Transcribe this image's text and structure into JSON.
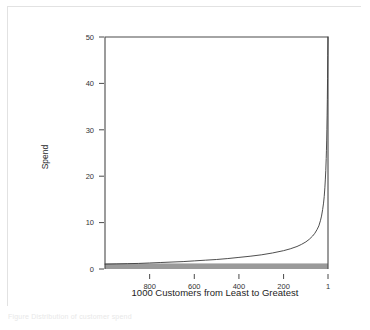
{
  "figure": {
    "caption_fragment": "Figure  Distribution of customer spend"
  },
  "chart_data": {
    "type": "line",
    "title": "",
    "xlabel": "1000 Customers from Least to Greatest",
    "ylabel": "Spend",
    "xlim": [
      1000,
      1
    ],
    "ylim": [
      0,
      50
    ],
    "x_reversed": true,
    "grid": false,
    "legend": "none",
    "xticks": [
      800,
      600,
      400,
      200,
      1
    ],
    "xticklabels": [
      "800",
      "600",
      "400",
      "200",
      "1"
    ],
    "yticks": [
      0,
      10,
      20,
      30,
      40,
      50
    ],
    "yticklabels": [
      "0",
      "10",
      "20",
      "30",
      "40",
      "50"
    ],
    "series": [
      {
        "name": "Spend",
        "type": "line",
        "color": "#3a3a3a",
        "x": [
          1000,
          950,
          900,
          850,
          800,
          750,
          700,
          650,
          600,
          550,
          500,
          450,
          400,
          350,
          300,
          250,
          200,
          170,
          140,
          120,
          100,
          85,
          70,
          60,
          50,
          42,
          35,
          30,
          25,
          21,
          18,
          15,
          13,
          11,
          9,
          8,
          7,
          6,
          5,
          4,
          3,
          2,
          1
        ],
        "y": [
          1.05,
          1.1,
          1.15,
          1.2,
          1.3,
          1.4,
          1.5,
          1.6,
          1.75,
          1.9,
          2.05,
          2.25,
          2.5,
          2.75,
          3.05,
          3.45,
          3.95,
          4.35,
          4.85,
          5.3,
          5.85,
          6.4,
          7.1,
          7.7,
          8.5,
          9.3,
          10.4,
          11.4,
          12.8,
          14.2,
          15.6,
          17.5,
          19.2,
          21.2,
          23.8,
          25.6,
          27.6,
          30.0,
          33.0,
          36.5,
          41.0,
          46.0,
          50.0
        ]
      },
      {
        "name": "Baseline band",
        "type": "area",
        "color": "#9a9a9a",
        "y_low": 0,
        "y_high": 1.2,
        "note": "shaded band spanning full x range just above zero"
      }
    ]
  }
}
